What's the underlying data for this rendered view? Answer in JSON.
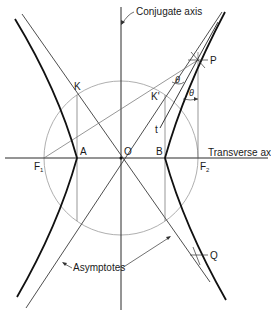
{
  "diagram": {
    "type": "hyperbola-construction",
    "labels": {
      "conjugate_axis": "Conjugate axis",
      "transverse_axis": "Transverse axis",
      "asymptotes": "Asymptotes",
      "center": "O",
      "vertex_left": "A",
      "vertex_right": "B",
      "focus_left": "F",
      "focus_left_sub": "1",
      "focus_right": "F",
      "focus_right_sub": "2",
      "point_k": "K",
      "point_k_prime": "K'",
      "point_p": "P",
      "point_q": "Q",
      "tangent": "t",
      "angle_1": "θ",
      "angle_2": "θ"
    },
    "colors": {
      "curve": "#111111",
      "line": "#3a3a3a",
      "circle": "#9a9a9a",
      "text": "#1a1a1a"
    }
  }
}
